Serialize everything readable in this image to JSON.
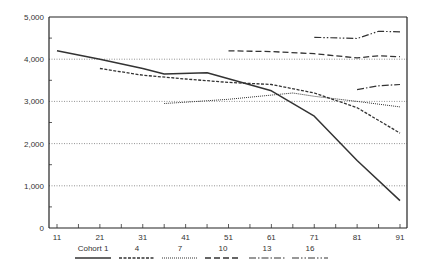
{
  "chart_data": {
    "type": "line",
    "title": "",
    "xlabel": "",
    "ylabel": "",
    "xlim": [
      11,
      91
    ],
    "ylim": [
      0,
      5000
    ],
    "grid": "horizontal dotted at 1000 intervals",
    "x_ticks": [
      "11",
      "21",
      "31",
      "41",
      "51",
      "61",
      "71",
      "81",
      "91"
    ],
    "y_ticks": [
      "0",
      "1,000",
      "2,000",
      "3,000",
      "4,000",
      "5,000"
    ],
    "legend_position": "bottom",
    "series": [
      {
        "name": "Cohort 1",
        "style": "solid",
        "x": [
          11,
          21,
          31,
          36,
          46,
          61,
          71,
          81,
          91
        ],
        "values": [
          4200,
          4000,
          3780,
          3650,
          3680,
          3250,
          2650,
          1600,
          650
        ]
      },
      {
        "name": "4",
        "style": "dashed",
        "x": [
          21,
          31,
          41,
          51,
          61,
          71,
          81,
          91
        ],
        "values": [
          3780,
          3620,
          3530,
          3450,
          3400,
          3200,
          2850,
          2250
        ]
      },
      {
        "name": "7",
        "style": "dotted",
        "x": [
          36,
          41,
          51,
          61,
          66,
          71,
          81,
          91
        ],
        "values": [
          2950,
          2980,
          3050,
          3150,
          3200,
          3120,
          3000,
          2870
        ]
      },
      {
        "name": "10",
        "style": "long-dash",
        "x": [
          51,
          61,
          71,
          81,
          86,
          91
        ],
        "values": [
          4200,
          4180,
          4130,
          4030,
          4080,
          4060
        ]
      },
      {
        "name": "13",
        "style": "dash-dot",
        "x": [
          81,
          86,
          91
        ],
        "values": [
          3280,
          3370,
          3400
        ]
      },
      {
        "name": "16",
        "style": "dash-dot-dot",
        "x": [
          71,
          81,
          86,
          91
        ],
        "values": [
          4520,
          4490,
          4660,
          4650
        ]
      }
    ]
  },
  "legend": {
    "items": [
      {
        "label": "Cohort 1"
      },
      {
        "label": "4"
      },
      {
        "label": "7"
      },
      {
        "label": "10"
      },
      {
        "label": "13"
      },
      {
        "label": "16"
      }
    ]
  }
}
